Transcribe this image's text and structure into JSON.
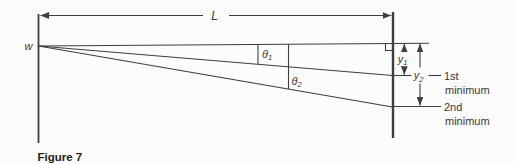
{
  "figure": {
    "caption": "Figure 7",
    "labels": {
      "slit_width": "w",
      "length": "L",
      "theta1": {
        "base": "θ",
        "sub": "1"
      },
      "theta2": {
        "base": "θ",
        "sub": "2"
      },
      "y1": {
        "base": "y",
        "sub": "1"
      },
      "y2": {
        "base": "y",
        "sub": "2"
      },
      "first_minimum": {
        "line1": "1st",
        "line2": "minimum"
      },
      "second_minimum": {
        "line1": "2nd",
        "line2": "minimum"
      }
    },
    "colors": {
      "line": "#3e3e3e",
      "text": "#383838",
      "caption": "#222222",
      "background": "#fcfcfc"
    }
  }
}
